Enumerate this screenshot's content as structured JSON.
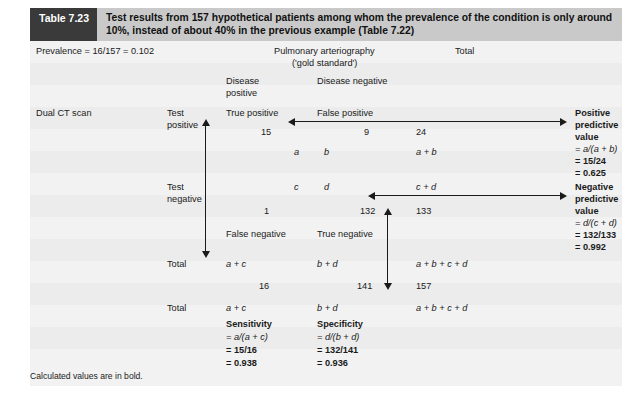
{
  "caption": {
    "tag": "Table 7.23",
    "text": "Test results from 157 hypothetical patients among whom the prevalence of the condition is only around 10%, instead of about 40% in the previous example (Table 7.22)"
  },
  "prevalence_line": "Prevalence = 16/157 = 0.102",
  "column_groups": {
    "gold_standard_line1": "Pulmonary arteriography",
    "gold_standard_line2": "('gold standard')",
    "total_header": "Total"
  },
  "column_headers": {
    "disease_positive_line1": "Disease",
    "disease_positive_line2": "positive",
    "disease_negative": "Disease negative"
  },
  "row_group_label": "Dual CT scan",
  "rows": {
    "test_positive": {
      "label_line1": "Test",
      "label_line2": "positive",
      "cell_a_name": "True positive",
      "cell_b_name": "False positive",
      "count_a": "15",
      "count_b": "9",
      "count_total": "24",
      "symbol_a": "a",
      "symbol_b": "b",
      "symbol_total": "a + b"
    },
    "test_negative": {
      "label_line1": "Test",
      "label_line2": "negative",
      "symbol_c": "c",
      "symbol_d": "d",
      "symbol_total": "c + d",
      "count_c": "1",
      "count_d": "132",
      "count_total": "133",
      "cell_c_name": "False negative",
      "cell_d_name": "True negative"
    },
    "total_upper": {
      "label": "Total",
      "symbol_col1": "a + c",
      "symbol_col2": "b + d",
      "symbol_col3": "a + b + c + d",
      "count_col1": "16",
      "count_col2": "141",
      "count_col3": "157"
    },
    "total_lower": {
      "label": "Total",
      "symbol_col1": "a + c",
      "symbol_col2": "b + d",
      "symbol_col3": "a + b + c + d"
    }
  },
  "derived": {
    "positive_predictive_value": {
      "title_line1": "Positive",
      "title_line2": "predictive",
      "title_line3": "value",
      "formula": "= a/(a + b)",
      "substitution": "= 15/24",
      "result": "= 0.625"
    },
    "negative_predictive_value": {
      "title_line1": "Negative",
      "title_line2": "predictive",
      "title_line3": "value",
      "formula": "= d/(c + d)",
      "substitution": "= 132/133",
      "result": "= 0.992"
    },
    "sensitivity": {
      "title": "Sensitivity",
      "formula": "= a/(a + c)",
      "substitution": "= 15/16",
      "result": "= 0.938"
    },
    "specificity": {
      "title": "Specificity",
      "formula": "= d/(b + d)",
      "substitution": "= 132/141",
      "result": "= 0.936"
    }
  },
  "footnote": "Calculated values are in bold.",
  "colors": {
    "tag_background": "#3a3a3a",
    "caption_background": "#c9c9c9",
    "table_background": "#f2f2f2",
    "band_background": "#ececec",
    "text": "#1a1a1a"
  }
}
